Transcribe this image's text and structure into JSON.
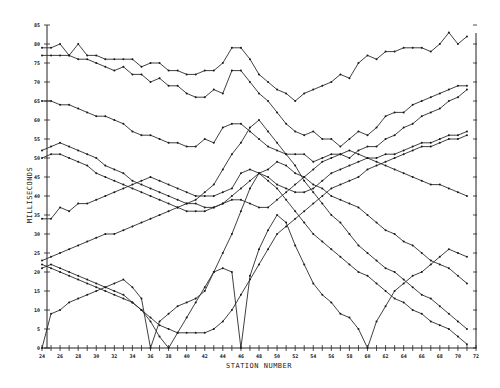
{
  "chart_data": {
    "type": "line",
    "title": "",
    "xlabel": "STATION NUMBER",
    "ylabel": "MILLISECONDS",
    "xlim": [
      24,
      72
    ],
    "ylim": [
      0,
      85
    ],
    "grid": false,
    "legend": null,
    "x_ticks": [
      24,
      26,
      28,
      30,
      32,
      34,
      36,
      38,
      40,
      42,
      44,
      46,
      48,
      50,
      52,
      54,
      56,
      58,
      60,
      62,
      64,
      66,
      68,
      70,
      72
    ],
    "x_tick_labels": [
      "24",
      "26",
      "28",
      "30",
      "32",
      "34",
      "36",
      "38",
      "40",
      "42",
      "44",
      "46",
      "48",
      "50",
      "52",
      "54",
      "56",
      "58",
      "60",
      "62",
      "64",
      "66",
      "68",
      "70",
      "72"
    ],
    "y_ticks": [
      0,
      5,
      10,
      15,
      20,
      25,
      30,
      35,
      40,
      45,
      50,
      55,
      60,
      65,
      70,
      75,
      80,
      85
    ],
    "y_tick_labels": [
      "0",
      "5",
      "10",
      "15",
      "20",
      "25",
      "30",
      "35",
      "40",
      "45",
      "50",
      "55",
      "60",
      "65",
      "70",
      "75",
      "80",
      "85"
    ],
    "x": [
      24,
      25,
      26,
      27,
      28,
      29,
      30,
      31,
      32,
      33,
      34,
      35,
      36,
      37,
      38,
      39,
      40,
      41,
      42,
      43,
      44,
      45,
      46,
      47,
      48,
      49,
      50,
      51,
      52,
      53,
      54,
      55,
      56,
      57,
      58,
      59,
      60,
      61,
      62,
      63,
      64,
      65,
      66,
      67,
      68,
      69,
      70,
      71
    ],
    "series": [
      {
        "name": "Curve A (top)",
        "values": [
          79,
          79,
          80,
          77,
          80,
          77,
          77,
          76,
          76,
          76,
          76,
          74,
          75,
          75,
          73,
          73,
          72,
          72,
          73,
          73,
          75,
          79,
          79,
          76,
          72,
          70,
          68,
          67,
          65,
          67,
          68,
          69,
          70,
          72,
          71,
          75,
          77,
          76,
          78,
          78,
          79,
          79,
          79,
          78,
          80,
          83,
          80,
          82
        ]
      },
      {
        "name": "Curve B",
        "values": [
          77,
          77,
          77,
          77,
          76,
          76,
          75,
          74,
          73,
          74,
          72,
          72,
          70,
          71,
          69,
          69,
          67,
          66,
          66,
          68,
          67,
          73,
          73,
          70,
          67,
          65,
          62,
          59,
          57,
          56,
          57,
          55,
          55,
          53,
          55,
          57,
          56,
          58,
          61,
          62,
          62,
          64,
          65,
          66,
          67,
          68,
          69,
          69
        ]
      },
      {
        "name": "Curve C",
        "values": [
          65,
          65,
          64,
          64,
          63,
          62,
          61,
          61,
          60,
          59,
          57,
          56,
          56,
          55,
          54,
          54,
          53,
          53,
          55,
          54,
          58,
          59,
          59,
          57,
          55,
          53,
          52,
          51,
          51,
          51,
          49,
          50,
          51,
          51,
          50,
          52,
          53,
          53,
          55,
          56,
          58,
          59,
          61,
          62,
          63,
          65,
          66,
          68
        ]
      },
      {
        "name": "Curve D",
        "values": [
          52,
          53,
          54,
          53,
          52,
          51,
          50,
          48,
          47,
          46,
          44,
          43,
          42,
          41,
          40,
          39,
          38,
          38,
          37,
          37,
          38,
          40,
          42,
          44,
          46,
          47,
          49,
          48,
          46,
          45,
          43,
          42,
          40,
          39,
          38,
          37,
          35,
          33,
          31,
          30,
          28,
          27,
          25,
          23,
          22,
          21,
          19,
          17
        ]
      },
      {
        "name": "Curve E",
        "values": [
          50,
          51,
          51,
          50,
          49,
          48,
          46,
          45,
          44,
          43,
          42,
          41,
          40,
          39,
          38,
          37,
          36,
          36,
          36,
          37,
          38,
          39,
          39,
          38,
          37,
          37,
          39,
          41,
          43,
          45,
          47,
          49,
          50,
          51,
          52,
          51,
          50,
          49,
          48,
          47,
          46,
          45,
          44,
          43,
          43,
          42,
          41,
          40
        ]
      },
      {
        "name": "Curve F",
        "values": [
          34,
          34,
          37,
          36,
          38,
          38,
          39,
          40,
          41,
          42,
          43,
          44,
          45,
          44,
          43,
          42,
          41,
          40,
          40,
          40,
          41,
          42,
          46,
          47,
          46,
          45,
          43,
          42,
          41,
          41,
          42,
          44,
          46,
          47,
          48,
          49,
          50,
          50,
          51,
          51,
          52,
          53,
          54,
          54,
          55,
          56,
          56,
          57
        ]
      },
      {
        "name": "Curve G",
        "values": [
          23,
          24,
          25,
          26,
          27,
          28,
          29,
          30,
          30,
          31,
          32,
          33,
          34,
          35,
          36,
          37,
          38,
          39,
          41,
          43,
          47,
          51,
          54,
          58,
          60,
          57,
          54,
          51,
          48,
          44,
          41,
          38,
          35,
          33,
          30,
          27,
          25,
          23,
          21,
          20,
          18,
          16,
          14,
          13,
          11,
          9,
          7,
          5
        ]
      },
      {
        "name": "Curve H",
        "values": [
          22,
          21,
          20,
          19,
          18,
          17,
          16,
          15,
          14,
          13,
          12,
          10,
          8,
          6,
          5,
          4,
          4,
          4,
          4,
          5,
          7,
          10,
          14,
          18,
          22,
          26,
          30,
          32,
          34,
          36,
          38,
          40,
          42,
          43,
          44,
          45,
          47,
          48,
          49,
          50,
          51,
          52,
          53,
          53,
          54,
          55,
          55,
          56
        ]
      },
      {
        "name": "Curve I",
        "values": [
          21,
          22,
          21,
          20,
          19,
          18,
          17,
          16,
          15,
          14,
          12,
          10,
          7,
          3,
          0,
          4,
          8,
          12,
          16,
          20,
          25,
          30,
          36,
          42,
          46,
          44,
          42,
          39,
          36,
          33,
          30,
          28,
          26,
          24,
          22,
          20,
          19,
          17,
          15,
          13,
          12,
          10,
          9,
          7,
          6,
          5,
          3,
          1
        ]
      },
      {
        "name": "Curve J (V-shaped)",
        "values": [
          0,
          9,
          10,
          12,
          13,
          14,
          15,
          16,
          17,
          18,
          16,
          13,
          0,
          7,
          9,
          11,
          12,
          13,
          15,
          20,
          21,
          20,
          0,
          19,
          26,
          31,
          35,
          33,
          27,
          22,
          17,
          14,
          12,
          9,
          8,
          5,
          0,
          7,
          11,
          15,
          17,
          19,
          20,
          22,
          24,
          26,
          25,
          24
        ]
      }
    ]
  }
}
